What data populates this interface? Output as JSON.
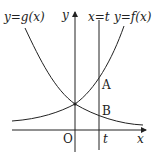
{
  "labels": {
    "g_curve": "y=g(x)",
    "f_curve": "y=f(x)",
    "line_t": "x=t",
    "y_axis": "y",
    "x_axis": "x",
    "origin": "O",
    "t_tick": "t",
    "point_a": "A",
    "point_b": "B"
  },
  "colors": {
    "stroke": "#222222",
    "background": "#ffffff"
  }
}
